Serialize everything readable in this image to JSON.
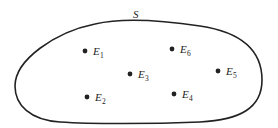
{
  "diagram": {
    "set_label": "S",
    "colors": {
      "stroke": "#222222",
      "point": "#222222",
      "background": "#ffffff"
    },
    "elements": [
      {
        "id": "E1",
        "letter": "E",
        "sub": "1",
        "x": 85,
        "y": 51
      },
      {
        "id": "E2",
        "letter": "E",
        "sub": "2",
        "x": 87,
        "y": 97
      },
      {
        "id": "E3",
        "letter": "E",
        "sub": "3",
        "x": 130,
        "y": 74
      },
      {
        "id": "E4",
        "letter": "E",
        "sub": "4",
        "x": 174,
        "y": 94
      },
      {
        "id": "E5",
        "letter": "E",
        "sub": "5",
        "x": 218,
        "y": 71
      },
      {
        "id": "E6",
        "letter": "E",
        "sub": "6",
        "x": 172,
        "y": 49
      }
    ]
  }
}
